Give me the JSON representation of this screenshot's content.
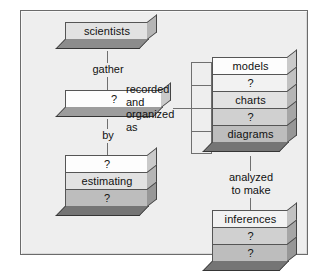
{
  "diagram": {
    "frame": {
      "background": "#eeeeee",
      "border_color": "#6b6b6b"
    },
    "nodes": [
      {
        "id": "scientists",
        "layers": [
          {
            "text": "scientists",
            "tone": "t2"
          }
        ]
      },
      {
        "id": "data",
        "layers": [
          {
            "text": "?",
            "tone": "t0"
          }
        ]
      },
      {
        "id": "methods",
        "layers": [
          {
            "text": "?",
            "tone": "t0"
          },
          {
            "text": "estimating",
            "tone": "t2"
          },
          {
            "text": "?",
            "tone": "t4"
          }
        ]
      },
      {
        "id": "representations",
        "layers": [
          {
            "text": "models",
            "tone": "t0"
          },
          {
            "text": "?",
            "tone": "t1"
          },
          {
            "text": "charts",
            "tone": "t2"
          },
          {
            "text": "?",
            "tone": "t3"
          },
          {
            "text": "diagrams",
            "tone": "t4"
          }
        ]
      },
      {
        "id": "inferences",
        "layers": [
          {
            "text": "inferences",
            "tone": "t1"
          },
          {
            "text": "?",
            "tone": "t3"
          },
          {
            "text": "?",
            "tone": "t4"
          }
        ]
      }
    ],
    "connector_labels": [
      {
        "id": "gather",
        "text": "gather"
      },
      {
        "id": "by",
        "text": "by"
      },
      {
        "id": "recorded-and-organized-as",
        "text": "recorded\nand\norganized\nas"
      },
      {
        "id": "analyzed-to-make",
        "text": "analyzed\nto make"
      }
    ]
  }
}
